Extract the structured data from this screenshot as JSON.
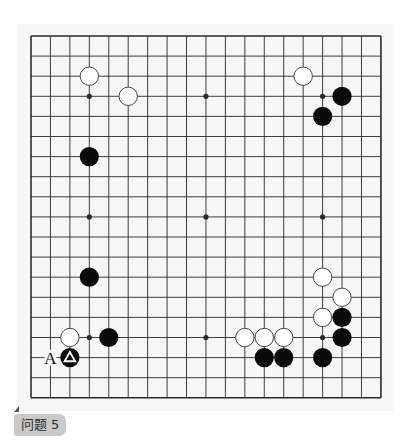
{
  "problem": {
    "label": "问题 5"
  },
  "board": {
    "size": 19,
    "origin_x": 31,
    "origin_y": 36,
    "step_x": 19.44,
    "step_y": 20.1,
    "stone_radius": 9.6,
    "colors": {
      "line": "#2a2a2a",
      "black": "#0a0a0a",
      "white_fill": "#ffffff",
      "white_stroke": "#333333",
      "background": "#f7f7f7"
    },
    "hoshi": [
      [
        3,
        3
      ],
      [
        9,
        3
      ],
      [
        15,
        3
      ],
      [
        3,
        9
      ],
      [
        9,
        9
      ],
      [
        15,
        9
      ],
      [
        3,
        15
      ],
      [
        9,
        15
      ],
      [
        15,
        15
      ]
    ],
    "stones": [
      {
        "color": "white",
        "col": 3,
        "row": 2
      },
      {
        "color": "white",
        "col": 5,
        "row": 3
      },
      {
        "color": "black",
        "col": 3,
        "row": 6
      },
      {
        "color": "white",
        "col": 14,
        "row": 2
      },
      {
        "color": "black",
        "col": 16,
        "row": 3
      },
      {
        "color": "black",
        "col": 15,
        "row": 4
      },
      {
        "color": "black",
        "col": 3,
        "row": 12
      },
      {
        "color": "white",
        "col": 2,
        "row": 15
      },
      {
        "color": "black",
        "col": 4,
        "row": 15
      },
      {
        "color": "black",
        "col": 2,
        "row": 16,
        "marker": "triangle"
      },
      {
        "color": "white",
        "col": 11,
        "row": 15
      },
      {
        "color": "white",
        "col": 12,
        "row": 15
      },
      {
        "color": "white",
        "col": 13,
        "row": 15
      },
      {
        "color": "black",
        "col": 12,
        "row": 16
      },
      {
        "color": "black",
        "col": 13,
        "row": 16
      },
      {
        "color": "black",
        "col": 15,
        "row": 16
      },
      {
        "color": "white",
        "col": 15,
        "row": 12
      },
      {
        "color": "white",
        "col": 16,
        "row": 13
      },
      {
        "color": "white",
        "col": 15,
        "row": 14
      },
      {
        "color": "black",
        "col": 16,
        "row": 14
      },
      {
        "color": "black",
        "col": 16,
        "row": 15
      }
    ],
    "labels": [
      {
        "text": "A",
        "col": 1,
        "row": 16
      }
    ]
  }
}
